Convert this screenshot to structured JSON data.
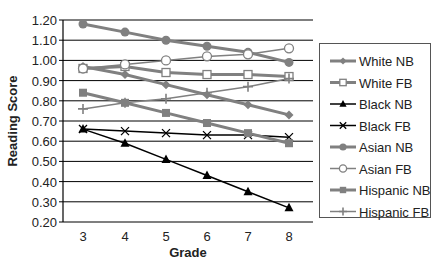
{
  "chart_data": {
    "type": "line",
    "title": "",
    "xlabel": "Grade",
    "ylabel": "Reading Score",
    "x": [
      3,
      4,
      5,
      6,
      7,
      8
    ],
    "x_tick_labels": [
      "3",
      "4",
      "5",
      "6",
      "7",
      "8"
    ],
    "ylim": [
      0.2,
      1.2
    ],
    "y_ticks": [
      0.2,
      0.3,
      0.4,
      0.5,
      0.6,
      0.7,
      0.8,
      0.9,
      1.0,
      1.1,
      1.2
    ],
    "y_tick_labels": [
      "0.20",
      "0.30",
      "0.40",
      "0.50",
      "0.60",
      "0.70",
      "0.80",
      "0.90",
      "1.00",
      "1.10",
      "1.20"
    ],
    "grid": true,
    "legend_position": "right",
    "series": [
      {
        "name": "White NB",
        "values": [
          0.97,
          0.93,
          0.88,
          0.83,
          0.78,
          0.73
        ],
        "color": "#808080",
        "marker": "diamond",
        "line_width": 3
      },
      {
        "name": "White FB",
        "values": [
          0.96,
          0.97,
          0.94,
          0.93,
          0.93,
          0.92
        ],
        "color": "#808080",
        "marker": "square-open",
        "line_width": 3
      },
      {
        "name": "Black NB",
        "values": [
          0.66,
          0.59,
          0.51,
          0.43,
          0.35,
          0.27
        ],
        "color": "#000000",
        "marker": "triangle",
        "line_width": 1.5
      },
      {
        "name": "Black FB",
        "values": [
          0.66,
          0.65,
          0.64,
          0.63,
          0.63,
          0.62
        ],
        "color": "#000000",
        "marker": "x",
        "line_width": 1.5
      },
      {
        "name": "Asian NB",
        "values": [
          1.18,
          1.14,
          1.1,
          1.07,
          1.04,
          0.99
        ],
        "color": "#808080",
        "marker": "circle",
        "line_width": 3
      },
      {
        "name": "Asian FB",
        "values": [
          0.96,
          0.98,
          1.0,
          1.02,
          1.03,
          1.06
        ],
        "color": "#808080",
        "marker": "circle-open",
        "line_width": 1.5
      },
      {
        "name": "Hispanic NB",
        "values": [
          0.84,
          0.79,
          0.74,
          0.69,
          0.64,
          0.59
        ],
        "color": "#808080",
        "marker": "square",
        "line_width": 3
      },
      {
        "name": "Hispanic FB",
        "values": [
          0.76,
          0.79,
          0.81,
          0.84,
          0.87,
          0.91
        ],
        "color": "#808080",
        "marker": "plus",
        "line_width": 1.5
      }
    ]
  },
  "axes": {
    "x_title": "Grade",
    "y_title": "Reading Score"
  },
  "legend": {
    "items": [
      {
        "label": "White NB"
      },
      {
        "label": "White FB"
      },
      {
        "label": "Black NB"
      },
      {
        "label": "Black FB"
      },
      {
        "label": "Asian NB"
      },
      {
        "label": "Asian FB"
      },
      {
        "label": "Hispanic NB"
      },
      {
        "label": "Hispanic FB"
      }
    ]
  }
}
